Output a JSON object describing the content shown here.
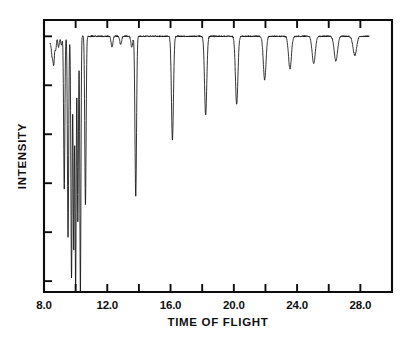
{
  "chart_data": {
    "type": "line",
    "title": "",
    "xlabel": "TIME OF FLIGHT",
    "ylabel": "INTENSITY",
    "xlim": [
      8.0,
      30.0
    ],
    "ylim": [
      0,
      100
    ],
    "grid": false,
    "legend": null,
    "x_tick_labels": [
      "8.0",
      "12.0",
      "16.0",
      "20.0",
      "24.0",
      "28.0"
    ],
    "x_tick_label_values": [
      8.0,
      12.0,
      16.0,
      20.0,
      24.0,
      28.0
    ],
    "x_minor_ticks": [
      10.0,
      14.0,
      18.0,
      22.0,
      26.0
    ],
    "y_tick_labels": [],
    "y_tick_values": [
      4,
      22,
      40,
      58,
      76,
      94
    ],
    "baseline_level": 94,
    "trace_start_x": 8.38,
    "trace_end_x": 28.55,
    "series": [
      {
        "name": "transmission",
        "dips": [
          {
            "x": 8.52,
            "depth": 6,
            "width": 0.07
          },
          {
            "x": 8.62,
            "depth": 9,
            "width": 0.06
          },
          {
            "x": 8.74,
            "depth": 5,
            "width": 0.06
          },
          {
            "x": 8.92,
            "depth": 4,
            "width": 0.07
          },
          {
            "x": 9.1,
            "depth": 3,
            "width": 0.07
          },
          {
            "x": 9.28,
            "depth": 56,
            "width": 0.055
          },
          {
            "x": 9.52,
            "depth": 74,
            "width": 0.055
          },
          {
            "x": 9.74,
            "depth": 89,
            "width": 0.055
          },
          {
            "x": 9.88,
            "depth": 78,
            "width": 0.05
          },
          {
            "x": 10.0,
            "depth": 92,
            "width": 0.05
          },
          {
            "x": 10.14,
            "depth": 68,
            "width": 0.05
          },
          {
            "x": 10.3,
            "depth": 94,
            "width": 0.05
          },
          {
            "x": 10.62,
            "depth": 62,
            "width": 0.06
          },
          {
            "x": 12.3,
            "depth": 4,
            "width": 0.08
          },
          {
            "x": 12.85,
            "depth": 3,
            "width": 0.08
          },
          {
            "x": 13.55,
            "depth": 4,
            "width": 0.08
          },
          {
            "x": 13.8,
            "depth": 59,
            "width": 0.07
          },
          {
            "x": 16.12,
            "depth": 38,
            "width": 0.09
          },
          {
            "x": 18.22,
            "depth": 29,
            "width": 0.1
          },
          {
            "x": 20.18,
            "depth": 25,
            "width": 0.11
          },
          {
            "x": 21.95,
            "depth": 16,
            "width": 0.12
          },
          {
            "x": 23.55,
            "depth": 12,
            "width": 0.13
          },
          {
            "x": 25.05,
            "depth": 10,
            "width": 0.14
          },
          {
            "x": 26.45,
            "depth": 9,
            "width": 0.15
          },
          {
            "x": 27.65,
            "depth": 7,
            "width": 0.16
          }
        ]
      }
    ]
  },
  "axes": {
    "x_axis_name": "time-of-flight-axis",
    "y_axis_name": "intensity-axis"
  }
}
